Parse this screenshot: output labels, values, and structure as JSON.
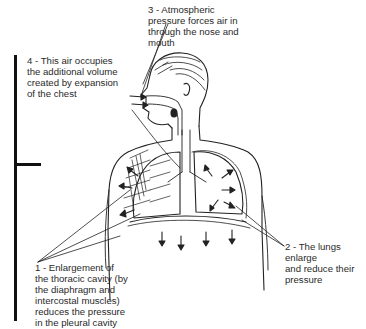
{
  "diagram": {
    "labels": {
      "step1": "1 - Enlargement of\nthe thoracic cavity (by\nthe diaphragm and\nintercostal muscles)\nreduces the pressure\nin the pleural cavity",
      "step2": "2 - The lungs enlarge\nand reduce their\npressure",
      "step3": "3 - Atmospheric\npressure forces air in\nthrough the nose and\nmouth",
      "step4": "4 - This air occupies\nthe additional volume\ncreated by expansion\nof the chest"
    },
    "parts": [
      "head",
      "nose",
      "mouth",
      "trachea",
      "lungs",
      "ribs",
      "intercostal-muscles",
      "diaphragm",
      "pleural-cavity"
    ]
  }
}
